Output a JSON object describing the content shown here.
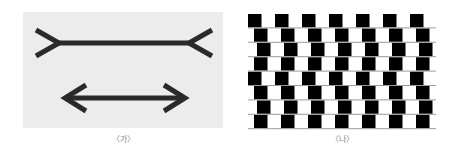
{
  "figures": [
    {
      "id": "muller-lyer",
      "caption": "〈가〉",
      "description": "Müller-Lyer illusion: two equal horizontal lines, top with outward fins, bottom with inward arrowheads",
      "background": "#ececec",
      "stroke_color": "#2a2a2a"
    },
    {
      "id": "cafe-wall",
      "caption": "〈나〉",
      "description": "Café wall illusion: rows of alternating black and white tiles offset per row, separated by gray mortar lines",
      "rows": 8,
      "tile_color": "#000000",
      "mortar_color": "#9a9a9a",
      "row_offsets_px": [
        0,
        6,
        9,
        6,
        0,
        6,
        9,
        6
      ]
    }
  ]
}
